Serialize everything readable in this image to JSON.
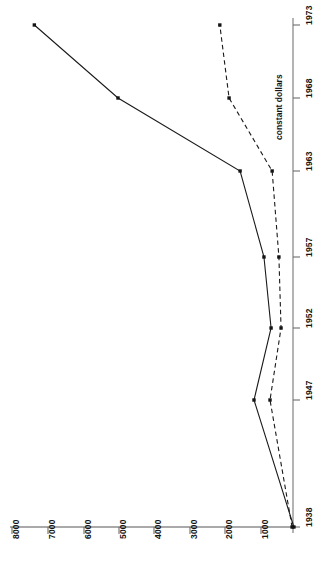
{
  "chart_data": {
    "type": "line",
    "title": "",
    "subtitle": "",
    "orientation": "rotated-90",
    "xlabel": "",
    "ylabel": "",
    "categories": [
      "1938",
      "1947",
      "1952",
      "1957",
      "1963",
      "1968",
      "1973"
    ],
    "value_axis_ticks": [
      "1000",
      "2000",
      "3000",
      "4000",
      "5000",
      "6000",
      "7000",
      "8000"
    ],
    "value_axis_range": [
      0,
      8200
    ],
    "grid": false,
    "legend_position": "inline-annotation",
    "annotations": [
      {
        "text": "constant dollars",
        "series": "constant dollars"
      }
    ],
    "series": [
      {
        "name": "current dollars",
        "style": "solid",
        "marker": "square",
        "values": [
          60,
          1180,
          700,
          900,
          1570,
          5000,
          7350
        ]
      },
      {
        "name": "constant dollars",
        "style": "dashed",
        "marker": "square",
        "values": [
          110,
          730,
          420,
          480,
          670,
          1880,
          2140
        ]
      }
    ],
    "colors": {
      "axis": "#8c8c8c",
      "series_current": "#1a1a1a",
      "series_constant": "#1a1a1a",
      "text": "#141414",
      "background": "#ffffff"
    }
  },
  "axes": {
    "value_axis": {
      "name": "value-axis",
      "ticks": [
        {
          "label": "8000",
          "x": 12
        },
        {
          "label": "7000",
          "x": 48
        },
        {
          "label": "6000",
          "x": 84
        },
        {
          "label": "5000",
          "x": 119
        },
        {
          "label": "4000",
          "x": 154
        },
        {
          "label": "3000",
          "x": 190
        },
        {
          "label": "2000",
          "x": 225
        },
        {
          "label": "1000",
          "x": 261
        }
      ]
    },
    "year_axis": {
      "name": "year-axis",
      "ticks": [
        {
          "label": "1938",
          "y": 527
        },
        {
          "label": "1947",
          "y": 400
        },
        {
          "label": "1952",
          "y": 328
        },
        {
          "label": "1957",
          "y": 257
        },
        {
          "label": "1963",
          "y": 171
        },
        {
          "label": "1968",
          "y": 98
        },
        {
          "label": "1973",
          "y": 25
        }
      ]
    }
  },
  "annotation": {
    "constant_dollars_label": "constant dollars"
  }
}
